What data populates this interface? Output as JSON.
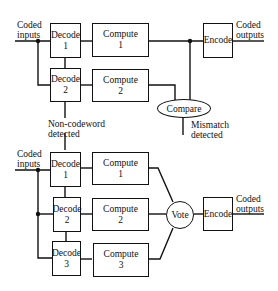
{
  "diagram": {
    "top": {
      "title": "Duplex with comparison",
      "input_label": [
        "Coded",
        "inputs"
      ],
      "output_label": [
        "Coded",
        "outputs"
      ],
      "decoders": [
        {
          "name": "Decode",
          "index": "1"
        },
        {
          "name": "Decode",
          "index": "2"
        }
      ],
      "computes": [
        {
          "name": "Compute",
          "index": "1"
        },
        {
          "name": "Compute",
          "index": "2"
        }
      ],
      "compare": "Compare",
      "encode": "Encode",
      "mismatch_label": [
        "Mismatch",
        "detected"
      ],
      "noncodeword_label": [
        "Non-codeword",
        "detected"
      ]
    },
    "bottom": {
      "title": "Triple modular redundancy with voting",
      "input_label": [
        "Coded",
        "inputs"
      ],
      "output_label": [
        "Coded",
        "outputs"
      ],
      "decoders": [
        {
          "name": "Decode",
          "index": "1"
        },
        {
          "name": "Decode",
          "index": "2"
        },
        {
          "name": "Decode",
          "index": "3"
        }
      ],
      "computes": [
        {
          "name": "Compute",
          "index": "1"
        },
        {
          "name": "Compute",
          "index": "2"
        },
        {
          "name": "Compute",
          "index": "3"
        }
      ],
      "vote": "Vote",
      "encode": "Encode"
    },
    "colors": {
      "line": "#111111",
      "background": "#ffffff"
    }
  }
}
